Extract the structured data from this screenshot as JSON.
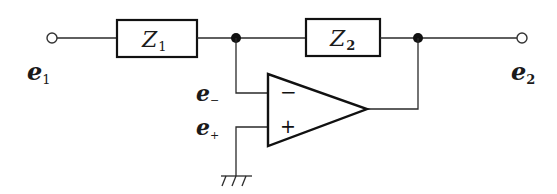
{
  "diagram": {
    "type": "op-amp circuit",
    "components": {
      "z1": {
        "label": "Z",
        "sub": "1"
      },
      "z2": {
        "label": "Z",
        "sub": "2"
      },
      "opamp": {
        "inverting_sign": "−",
        "noninverting_sign": "+"
      }
    },
    "labels": {
      "input": {
        "main": "e",
        "sub": "1"
      },
      "output": {
        "main": "e",
        "sub": "2"
      },
      "inverting_input": {
        "main": "e",
        "sub": "−"
      },
      "noninverting_input": {
        "main": "e",
        "sub": "+"
      }
    },
    "colors": {
      "stroke": "#111111",
      "background": "#ffffff"
    }
  }
}
